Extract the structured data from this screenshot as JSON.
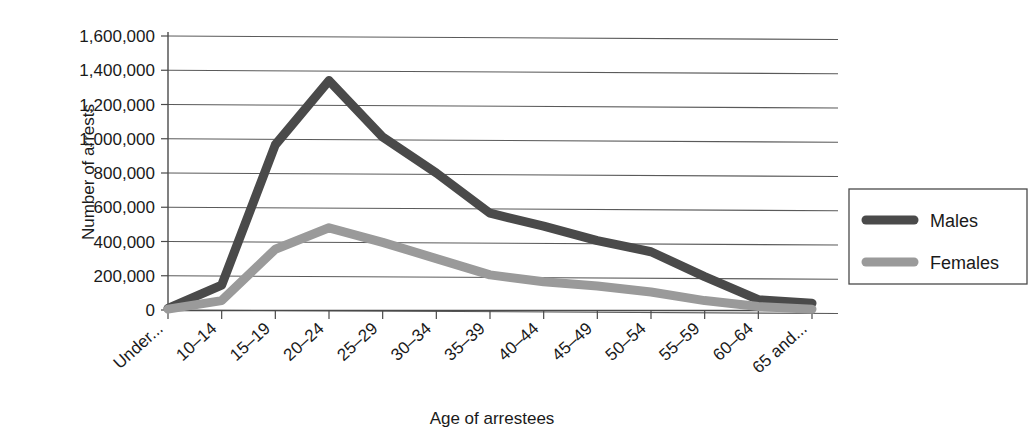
{
  "chart_data": {
    "type": "line",
    "title": "",
    "xlabel": "Age of arrestees",
    "ylabel": "Number of arrests",
    "categories": [
      "Under...",
      "10–14",
      "15–19",
      "20–24",
      "25–29",
      "30–34",
      "35–39",
      "40–44",
      "45–49",
      "50–54",
      "55–59",
      "60–64",
      "65 and..."
    ],
    "series": [
      {
        "name": "Males",
        "color": "#4a4a4a",
        "values": [
          10000,
          145000,
          965000,
          1340000,
          1010000,
          800000,
          565000,
          490000,
          405000,
          340000,
          195000,
          60000,
          40000
        ]
      },
      {
        "name": "Females",
        "color": "#9a9a9a",
        "values": [
          5000,
          55000,
          355000,
          480000,
          395000,
          300000,
          205000,
          165000,
          140000,
          105000,
          55000,
          20000,
          5000
        ]
      }
    ],
    "ylim": [
      0,
      1600000
    ],
    "ytick_labels": [
      "1,600,000",
      "1,400,000",
      "1,200,000",
      "1,000,000",
      "800,000",
      "600,000",
      "400,000",
      "200,000",
      "0"
    ],
    "ytick_values": [
      1600000,
      1400000,
      1200000,
      1000000,
      800000,
      600000,
      400000,
      200000,
      0
    ],
    "grid": true,
    "legend_position": "right",
    "legend_entries": [
      "Males",
      "Females"
    ]
  },
  "legend": {
    "items": [
      {
        "label": "Males",
        "color": "#4a4a4a"
      },
      {
        "label": "Females",
        "color": "#9a9a9a"
      }
    ]
  },
  "axes": {
    "y_title": "Number of arrests",
    "x_title": "Age of arrestees"
  }
}
